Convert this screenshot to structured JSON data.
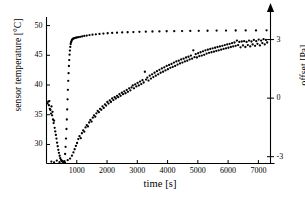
{
  "chart_data": {
    "type": "scatter",
    "title": "",
    "xlabel": "time [s]",
    "ylabel": "sensor temperature  [°C]",
    "y2label": "offset [Pa]",
    "xlim": [
      0,
      7400
    ],
    "ylim": [
      26.8,
      50.6
    ],
    "y2lim": [
      -3.35,
      3.9
    ],
    "grid": false,
    "legend": "none",
    "xticks": [
      1000,
      2000,
      3000,
      4000,
      5000,
      6000,
      7000
    ],
    "xtick_labels": [
      "1000",
      "2000",
      "3000",
      "4000",
      "5000",
      "6000",
      "7000"
    ],
    "yticks": [
      30,
      35,
      40,
      45,
      50
    ],
    "ytick_labels": [
      "30",
      "35",
      "40",
      "45",
      "50"
    ],
    "y2ticks": [
      -3,
      0,
      3
    ],
    "y2tick_labels": [
      "-3",
      "0",
      "3"
    ],
    "right_axis_arrow": true,
    "series": [
      {
        "name": "sensor temperature",
        "axis": "left",
        "marker": "filled-circle",
        "color": "#000000",
        "points": [
          [
            30,
            36.9
          ],
          [
            55,
            37.2
          ],
          [
            80,
            36.6
          ],
          [
            95,
            37.3
          ],
          [
            110,
            36.0
          ],
          [
            130,
            35.8
          ],
          [
            150,
            35.2
          ],
          [
            165,
            36.4
          ],
          [
            185,
            34.9
          ],
          [
            200,
            35.5
          ],
          [
            215,
            34.2
          ],
          [
            235,
            33.6
          ],
          [
            250,
            34.0
          ],
          [
            270,
            32.8
          ],
          [
            290,
            32.2
          ],
          [
            310,
            31.6
          ],
          [
            330,
            31.0
          ],
          [
            350,
            30.3
          ],
          [
            370,
            29.7
          ],
          [
            390,
            29.1
          ],
          [
            410,
            28.6
          ],
          [
            435,
            28.1
          ],
          [
            455,
            27.7
          ],
          [
            480,
            27.4
          ],
          [
            505,
            27.2
          ],
          [
            530,
            27.1
          ],
          [
            560,
            27.0
          ],
          [
            590,
            27.2
          ],
          [
            615,
            28.4
          ],
          [
            630,
            29.6
          ],
          [
            645,
            31.0
          ],
          [
            660,
            32.6
          ],
          [
            672,
            34.2
          ],
          [
            684,
            35.9
          ],
          [
            696,
            37.6
          ],
          [
            707,
            39.2
          ],
          [
            718,
            40.7
          ],
          [
            729,
            42.0
          ],
          [
            740,
            43.2
          ],
          [
            751,
            44.2
          ],
          [
            762,
            45.1
          ],
          [
            774,
            45.8
          ],
          [
            786,
            46.4
          ],
          [
            799,
            46.9
          ],
          [
            812,
            47.2
          ],
          [
            826,
            47.4
          ],
          [
            842,
            47.6
          ],
          [
            860,
            47.7
          ],
          [
            880,
            47.8
          ],
          [
            905,
            47.85
          ],
          [
            935,
            47.9
          ],
          [
            970,
            47.95
          ],
          [
            1010,
            48.0
          ],
          [
            1060,
            48.05
          ],
          [
            1115,
            48.1
          ],
          [
            1180,
            48.18
          ],
          [
            1250,
            48.25
          ],
          [
            1330,
            48.32
          ],
          [
            1420,
            48.4
          ],
          [
            1520,
            48.47
          ],
          [
            1630,
            48.53
          ],
          [
            1750,
            48.6
          ],
          [
            1880,
            48.66
          ],
          [
            2020,
            48.71
          ],
          [
            2170,
            48.76
          ],
          [
            2330,
            48.8
          ],
          [
            2500,
            48.84
          ],
          [
            2680,
            48.88
          ],
          [
            2870,
            48.91
          ],
          [
            3070,
            48.94
          ],
          [
            3280,
            48.97
          ],
          [
            3500,
            49.0
          ],
          [
            3730,
            49.02
          ],
          [
            3970,
            49.04
          ],
          [
            4220,
            49.06
          ],
          [
            4480,
            49.08
          ],
          [
            4750,
            49.1
          ],
          [
            5030,
            49.12
          ],
          [
            5320,
            49.13
          ],
          [
            5620,
            49.15
          ],
          [
            5930,
            49.16
          ],
          [
            6250,
            49.17
          ],
          [
            6580,
            49.18
          ],
          [
            6920,
            49.19
          ],
          [
            7270,
            49.2
          ]
        ]
      },
      {
        "name": "offset",
        "axis": "right",
        "marker": "filled-circle",
        "color": "#000000",
        "points": [
          [
            160,
            -3.25
          ],
          [
            250,
            -3.3
          ],
          [
            340,
            -3.2
          ],
          [
            430,
            -3.28
          ],
          [
            520,
            -3.22
          ],
          [
            610,
            -3.3
          ],
          [
            700,
            -3.18
          ],
          [
            780,
            -3.1
          ],
          [
            840,
            -2.95
          ],
          [
            890,
            -2.78
          ],
          [
            930,
            -2.62
          ],
          [
            970,
            -2.45
          ],
          [
            1010,
            -2.3
          ],
          [
            1050,
            -2.1
          ],
          [
            1090,
            -1.95
          ],
          [
            1130,
            -2.05
          ],
          [
            1170,
            -1.8
          ],
          [
            1210,
            -1.65
          ],
          [
            1250,
            -1.72
          ],
          [
            1290,
            -1.5
          ],
          [
            1330,
            -1.38
          ],
          [
            1370,
            -1.45
          ],
          [
            1410,
            -1.25
          ],
          [
            1450,
            -1.12
          ],
          [
            1490,
            -1.2
          ],
          [
            1530,
            -1.0
          ],
          [
            1570,
            -0.88
          ],
          [
            1610,
            -0.95
          ],
          [
            1650,
            -0.78
          ],
          [
            1690,
            -0.65
          ],
          [
            1730,
            -0.72
          ],
          [
            1770,
            -0.55
          ],
          [
            1810,
            -0.6
          ],
          [
            1850,
            -0.42
          ],
          [
            1890,
            -0.5
          ],
          [
            1930,
            -0.32
          ],
          [
            1970,
            -0.38
          ],
          [
            2010,
            -0.2
          ],
          [
            2050,
            -0.28
          ],
          [
            2090,
            -0.12
          ],
          [
            2130,
            -0.2
          ],
          [
            2170,
            -0.02
          ],
          [
            2210,
            -0.1
          ],
          [
            2250,
            0.05
          ],
          [
            2290,
            -0.02
          ],
          [
            2330,
            0.12
          ],
          [
            2370,
            0.05
          ],
          [
            2410,
            0.2
          ],
          [
            2450,
            0.12
          ],
          [
            2490,
            0.28
          ],
          [
            2530,
            0.2
          ],
          [
            2570,
            0.35
          ],
          [
            2610,
            0.25
          ],
          [
            2650,
            0.42
          ],
          [
            2690,
            0.32
          ],
          [
            2730,
            0.5
          ],
          [
            2770,
            0.4
          ],
          [
            2810,
            0.55
          ],
          [
            2850,
            0.65
          ],
          [
            2890,
            0.5
          ],
          [
            2930,
            0.7
          ],
          [
            2970,
            0.6
          ],
          [
            3010,
            0.78
          ],
          [
            3050,
            0.65
          ],
          [
            3090,
            0.85
          ],
          [
            3130,
            0.72
          ],
          [
            3170,
            0.92
          ],
          [
            3210,
            0.8
          ],
          [
            3250,
            1.35
          ],
          [
            3290,
            0.95
          ],
          [
            3330,
            1.05
          ],
          [
            3370,
            0.9
          ],
          [
            3410,
            1.15
          ],
          [
            3450,
            1.0
          ],
          [
            3490,
            1.22
          ],
          [
            3530,
            1.08
          ],
          [
            3570,
            1.3
          ],
          [
            3610,
            1.15
          ],
          [
            3650,
            1.38
          ],
          [
            3690,
            1.22
          ],
          [
            3730,
            1.45
          ],
          [
            3770,
            1.3
          ],
          [
            3810,
            1.52
          ],
          [
            3850,
            1.35
          ],
          [
            3890,
            1.58
          ],
          [
            3930,
            1.42
          ],
          [
            3970,
            1.65
          ],
          [
            4010,
            1.48
          ],
          [
            4050,
            1.7
          ],
          [
            4090,
            1.55
          ],
          [
            4130,
            1.75
          ],
          [
            4170,
            1.6
          ],
          [
            4210,
            1.82
          ],
          [
            4250,
            1.65
          ],
          [
            4290,
            1.88
          ],
          [
            4330,
            1.72
          ],
          [
            4370,
            1.92
          ],
          [
            4410,
            1.78
          ],
          [
            4450,
            1.98
          ],
          [
            4490,
            1.82
          ],
          [
            4530,
            2.02
          ],
          [
            4570,
            1.88
          ],
          [
            4610,
            2.08
          ],
          [
            4650,
            1.92
          ],
          [
            4690,
            2.12
          ],
          [
            4730,
            1.98
          ],
          [
            4770,
            2.18
          ],
          [
            4810,
            2.02
          ],
          [
            4850,
            2.45
          ],
          [
            4890,
            2.1
          ],
          [
            4930,
            2.25
          ],
          [
            4970,
            2.08
          ],
          [
            5010,
            2.3
          ],
          [
            5050,
            2.15
          ],
          [
            5090,
            2.35
          ],
          [
            5130,
            2.18
          ],
          [
            5170,
            2.4
          ],
          [
            5210,
            2.22
          ],
          [
            5250,
            2.45
          ],
          [
            5290,
            2.28
          ],
          [
            5330,
            2.48
          ],
          [
            5370,
            2.32
          ],
          [
            5410,
            2.52
          ],
          [
            5450,
            2.35
          ],
          [
            5490,
            2.55
          ],
          [
            5530,
            2.38
          ],
          [
            5570,
            2.58
          ],
          [
            5610,
            2.42
          ],
          [
            5650,
            2.62
          ],
          [
            5690,
            2.45
          ],
          [
            5730,
            2.65
          ],
          [
            5770,
            2.48
          ],
          [
            5810,
            2.68
          ],
          [
            5850,
            2.52
          ],
          [
            5890,
            2.72
          ],
          [
            5930,
            2.55
          ],
          [
            5970,
            2.75
          ],
          [
            6010,
            2.58
          ],
          [
            6050,
            2.78
          ],
          [
            6090,
            2.62
          ],
          [
            6130,
            2.82
          ],
          [
            6170,
            2.65
          ],
          [
            6210,
            2.85
          ],
          [
            6250,
            2.68
          ],
          [
            6290,
            2.95
          ],
          [
            6330,
            2.72
          ],
          [
            6370,
            2.88
          ],
          [
            6410,
            2.6
          ],
          [
            6450,
            2.9
          ],
          [
            6490,
            2.7
          ],
          [
            6530,
            2.92
          ],
          [
            6570,
            2.62
          ],
          [
            6610,
            2.88
          ],
          [
            6650,
            2.72
          ],
          [
            6690,
            2.95
          ],
          [
            6730,
            2.65
          ],
          [
            6770,
            2.9
          ],
          [
            6810,
            2.75
          ],
          [
            6850,
            2.98
          ],
          [
            6890,
            2.68
          ],
          [
            6930,
            2.92
          ],
          [
            6970,
            2.78
          ],
          [
            7010,
            3.0
          ],
          [
            7050,
            2.7
          ],
          [
            7090,
            2.95
          ],
          [
            7130,
            2.82
          ],
          [
            7170,
            3.02
          ],
          [
            7210,
            2.75
          ],
          [
            7250,
            2.98
          ],
          [
            7290,
            2.85
          ]
        ]
      }
    ]
  }
}
